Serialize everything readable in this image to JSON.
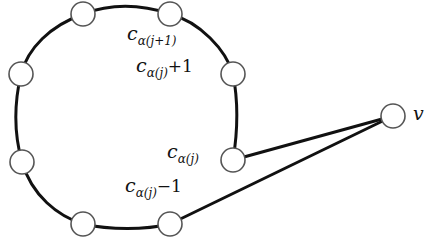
{
  "diagram": {
    "type": "graph",
    "nodes": [
      {
        "id": "n1",
        "x": 83,
        "y": 14
      },
      {
        "id": "n2",
        "x": 170,
        "y": 14,
        "label_ref": "c_alpha_j_plus1"
      },
      {
        "id": "n3",
        "x": 233,
        "y": 74,
        "label_ref": "c_alpha_j_plus_1"
      },
      {
        "id": "n4",
        "x": 233,
        "y": 160,
        "label_ref": "c_alpha_j"
      },
      {
        "id": "n5",
        "x": 170,
        "y": 224,
        "label_ref": "c_alpha_j_minus_1"
      },
      {
        "id": "n6",
        "x": 83,
        "y": 224
      },
      {
        "id": "n7",
        "x": 22,
        "y": 162
      },
      {
        "id": "n8",
        "x": 21,
        "y": 74
      },
      {
        "id": "v",
        "x": 393,
        "y": 116,
        "label_ref": "v"
      }
    ],
    "edges": [
      [
        "n4",
        "v"
      ],
      [
        "n5",
        "v"
      ]
    ],
    "labels": {
      "c_alpha_j_plus1": {
        "base": "c",
        "sub_greek": "α",
        "sub_rest": "(j+1)",
        "tail": ""
      },
      "c_alpha_j_plus_1": {
        "base": "c",
        "sub_greek": "α",
        "sub_rest": "(j)",
        "tail": "+1"
      },
      "c_alpha_j": {
        "base": "c",
        "sub_greek": "α",
        "sub_rest": "(j)",
        "tail": ""
      },
      "c_alpha_j_minus_1": {
        "base": "c",
        "sub_greek": "α",
        "sub_rest": "(j)",
        "tail": "−1"
      },
      "v": "v"
    },
    "colors": {
      "stroke": "#111111",
      "node_stroke": "#555555",
      "node_fill": "#ffffff"
    }
  }
}
